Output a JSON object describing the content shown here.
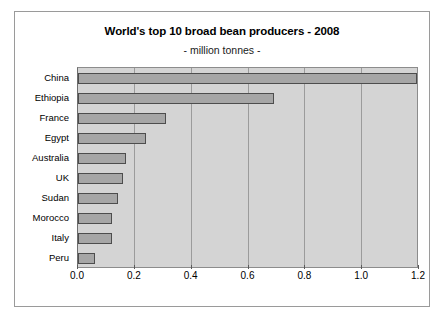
{
  "chart_data": {
    "type": "bar",
    "orientation": "horizontal",
    "title": "World's top 10 broad bean producers - 2008",
    "subtitle": "- million tonnes -",
    "xlabel": "",
    "ylabel": "",
    "categories": [
      "China",
      "Ethiopia",
      "France",
      "Egypt",
      "Australia",
      "UK",
      "Sudan",
      "Morocco",
      "Italy",
      "Peru"
    ],
    "values": [
      1.2,
      0.69,
      0.31,
      0.24,
      0.17,
      0.16,
      0.14,
      0.12,
      0.12,
      0.06
    ],
    "xlim": [
      0.0,
      1.2
    ],
    "xticks": [
      "0.0",
      "0.2",
      "0.4",
      "0.6",
      "0.8",
      "1.0",
      "1.2"
    ],
    "xtick_values": [
      0.0,
      0.2,
      0.4,
      0.6,
      0.8,
      1.0,
      1.2
    ],
    "grid": "vertical",
    "legend": "none",
    "colors": {
      "bar_fill": "#a6a6a6",
      "bar_border": "#4d4d4d",
      "plot_background": "#d4d4d4",
      "gridline": "#9b9b9b",
      "frame_border": "#9a9a9a",
      "text": "#000000"
    }
  }
}
